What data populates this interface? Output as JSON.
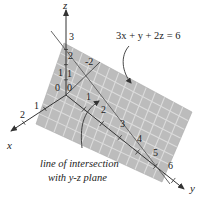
{
  "figure": {
    "equation": "3x + y + 2z = 6",
    "axes": {
      "x_label": "x",
      "y_label": "y",
      "z_label": "z"
    },
    "ticks": {
      "x": [
        "0",
        "1",
        "2"
      ],
      "y": [
        "1",
        "2",
        "3",
        "4",
        "5",
        "6"
      ],
      "z": [
        "0",
        "1",
        "2",
        "3"
      ],
      "extra": [
        "-2"
      ]
    },
    "annotation_line1": "line of intersection",
    "annotation_line2": "with y-z plane",
    "colors": {
      "plane_fill": "#b9b9b9",
      "grid": "#dedede",
      "axis": "#333333",
      "text": "#222222"
    }
  }
}
